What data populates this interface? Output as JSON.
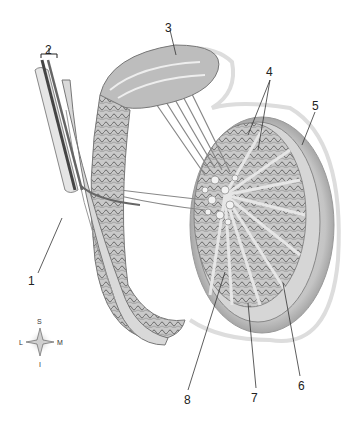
{
  "diagram": {
    "labels": [
      {
        "id": "1",
        "text": "1",
        "x": 32,
        "y": 275
      },
      {
        "id": "2",
        "text": "2",
        "x": 46,
        "y": 44
      },
      {
        "id": "3",
        "text": "3",
        "x": 166,
        "y": 24
      },
      {
        "id": "4",
        "text": "4",
        "x": 270,
        "y": 66
      },
      {
        "id": "5",
        "text": "5",
        "x": 312,
        "y": 100
      },
      {
        "id": "6",
        "text": "6",
        "x": 298,
        "y": 382
      },
      {
        "id": "7",
        "text": "7",
        "x": 253,
        "y": 392
      },
      {
        "id": "8",
        "text": "8",
        "x": 185,
        "y": 394
      }
    ],
    "compass": {
      "superior": "S",
      "inferior": "I",
      "lateral": "L",
      "medial": "M"
    }
  }
}
